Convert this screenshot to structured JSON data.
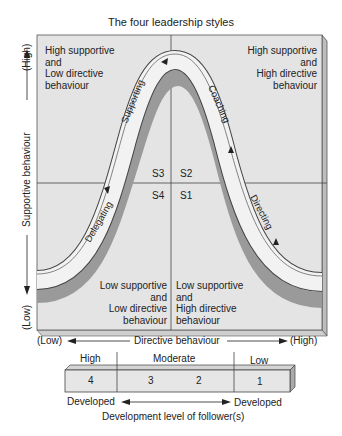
{
  "title": "The four leadership styles",
  "y_axis": {
    "label": "Supportive behaviour",
    "high": "(High)",
    "low": "(Low)"
  },
  "x_axis": {
    "label": "Directive behaviour",
    "low": "(Low)",
    "high": "(High)"
  },
  "quadrants": {
    "top_left": [
      "High supportive",
      "and",
      "Low directive",
      "behaviour"
    ],
    "top_right": [
      "High supportive",
      "and",
      "High directive",
      "behaviour"
    ],
    "bottom_left": [
      "Low supportive",
      "and",
      "Low directive",
      "behaviour"
    ],
    "bottom_right": [
      "Low supportive",
      "and",
      "High directive",
      "behaviour"
    ]
  },
  "styles": {
    "s1": "S1",
    "s2": "S2",
    "s3": "S3",
    "s4": "S4"
  },
  "curve_labels": {
    "supporting": "Supporting",
    "coaching": "Coaching",
    "delegating": "Delegating",
    "directing": "Directing"
  },
  "development_bar": {
    "headers": {
      "high": "High",
      "moderate": "Moderate",
      "low": "Low"
    },
    "cells": [
      "4",
      "3",
      "2",
      "1"
    ],
    "left_label": "Developed",
    "right_label": "Developed",
    "caption": "Development level of follower(s)"
  },
  "colors": {
    "panel": "#e4e4e4",
    "panel_edge": "#bdbdbd",
    "band": "#f2f2f2",
    "shadow": "#9a9a9a",
    "line": "#444444"
  }
}
